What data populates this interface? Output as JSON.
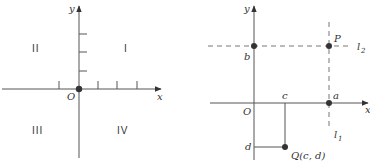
{
  "left_diagram": {
    "axis_labels": {
      "x": "x",
      "y": "y",
      "origin": "O"
    },
    "quadrants": {
      "first": "I",
      "second": "II",
      "third": "III",
      "fourth": "IV"
    },
    "y_ticks_count": 3,
    "x_ticks_count": 4
  },
  "right_diagram": {
    "axis_labels": {
      "x": "x",
      "y": "y",
      "origin": "O"
    },
    "points": {
      "P": "P",
      "Q": "Q(c, d)",
      "a": "a",
      "b": "b",
      "c": "c",
      "d": "d"
    },
    "lines": {
      "l1": {
        "letter": "l",
        "sub": "1"
      },
      "l2": {
        "letter": "l",
        "sub": "2"
      }
    }
  },
  "colors": {
    "ink": "#333333",
    "axis": "#555555",
    "dashed": "#777777"
  }
}
